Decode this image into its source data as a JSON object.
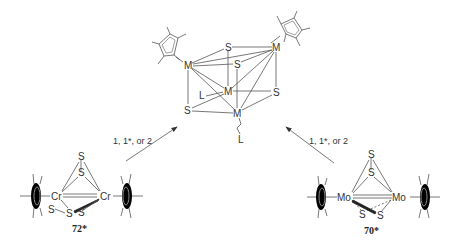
{
  "product": {
    "metal_label": "M",
    "sulfur_label": "S",
    "ligand_label": "L"
  },
  "reactants": [
    {
      "id": "left",
      "metal_label": "Cr",
      "sulfur_label": "S",
      "compound_number": "72*",
      "arrow_condition": "1, 1*, or 2"
    },
    {
      "id": "right",
      "metal_label": "Mo",
      "sulfur_label": "S",
      "compound_number": "70*",
      "arrow_condition": "1, 1*, or 2"
    }
  ],
  "colors": {
    "ink": "#333333",
    "background": "#ffffff"
  }
}
